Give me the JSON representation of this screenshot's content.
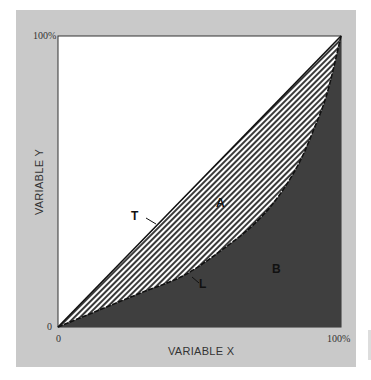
{
  "chart_data": {
    "type": "area",
    "title": "",
    "xlabel": "VARIABLE X",
    "ylabel": "VARIABLE Y",
    "xlim": [
      0,
      100
    ],
    "ylim": [
      0,
      100
    ],
    "x_ticks": [
      "0",
      "100%"
    ],
    "y_ticks": [
      "0",
      "100%"
    ],
    "grid": false,
    "series": [
      {
        "name": "T",
        "description": "line of equality (diagonal)",
        "x": [
          0,
          100
        ],
        "values": [
          0,
          100
        ]
      },
      {
        "name": "L",
        "description": "Lorenz curve",
        "x": [
          0,
          15,
          30,
          45,
          60,
          70,
          78,
          85,
          90,
          95,
          100
        ],
        "values": [
          0,
          6,
          12,
          18,
          28,
          36,
          45,
          56,
          67,
          80,
          100
        ]
      }
    ],
    "regions": [
      {
        "name": "A",
        "description": "area between T and L (hatched)"
      },
      {
        "name": "B",
        "description": "area under L (dark shaded)"
      }
    ],
    "annotations": [
      "T",
      "L",
      "A",
      "B"
    ]
  },
  "labels": {
    "y_top": "100%",
    "y_zero": "0",
    "x_zero": "0",
    "x_right": "100%",
    "xlabel": "VARIABLE X",
    "ylabel": "VARIABLE Y",
    "T": "T",
    "L": "L",
    "A": "A",
    "B": "B"
  },
  "colors": {
    "panel": "#c9c9c9",
    "plot_bg": "#ffffff",
    "region_B": "#3f3f3f",
    "hatch_dark": "#3a3a3a",
    "hatch_light": "#ffffff",
    "line": "#111111"
  }
}
